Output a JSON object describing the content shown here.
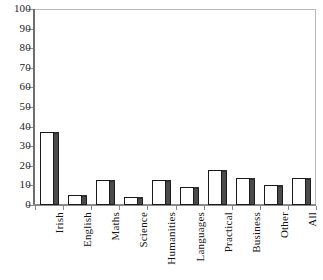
{
  "chart_data": {
    "type": "bar",
    "title": "",
    "subtitle": "",
    "xlabel": "",
    "ylabel": "",
    "ylim": [
      0,
      100
    ],
    "ytick_step": 10,
    "yticks": [
      0,
      10,
      20,
      30,
      40,
      50,
      60,
      70,
      80,
      90,
      100
    ],
    "ytick_labels": [
      "0",
      "10",
      "20",
      "30",
      "40",
      "50",
      "60",
      "70",
      "80",
      "90",
      "100"
    ],
    "grid": false,
    "legend": false,
    "legend_position": "none",
    "categories": [
      "Irish",
      "English",
      "Maths",
      "Science",
      "Humanities",
      "Languages",
      "Practical",
      "Business",
      "Other",
      "All"
    ],
    "values": [
      37,
      5,
      13,
      4,
      13,
      9,
      18,
      14,
      10,
      14
    ],
    "series": [
      {
        "name": "",
        "values": [
          37,
          5,
          13,
          4,
          13,
          9,
          18,
          14,
          10,
          14
        ]
      }
    ],
    "bar_style": {
      "face_color": "#FFFFFF",
      "edge_color": "#1A1A1A",
      "side_color": "#4B4B4B",
      "three_d": true
    },
    "axis_style": {
      "frame_color": "#B9B9B9",
      "value_axis_color": "#6E6E6E",
      "category_axis_color": "#8A8A8A",
      "tick_color": "#8F8F8F",
      "text_color": "#141414"
    }
  }
}
